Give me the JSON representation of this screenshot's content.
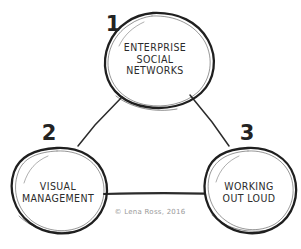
{
  "diagram": {
    "background_color": "#ffffff",
    "stroke_color": "#262626",
    "style": "hand-drawn sketch",
    "nodes": [
      {
        "number": "1",
        "label": "ENTERPRISE\nSOCIAL\nNETWORKS",
        "position": "top"
      },
      {
        "number": "2",
        "label": "VISUAL\nMANAGEMENT",
        "position": "bottom-left"
      },
      {
        "number": "3",
        "label": "WORKING\nOUT LOUD",
        "position": "bottom-right"
      }
    ],
    "connectors": [
      {
        "from": "1",
        "to": "2"
      },
      {
        "from": "1",
        "to": "3"
      },
      {
        "from": "2",
        "to": "3"
      }
    ],
    "caption": "© Lena Ross, 2016",
    "caption_color": "#9a9a9a"
  }
}
